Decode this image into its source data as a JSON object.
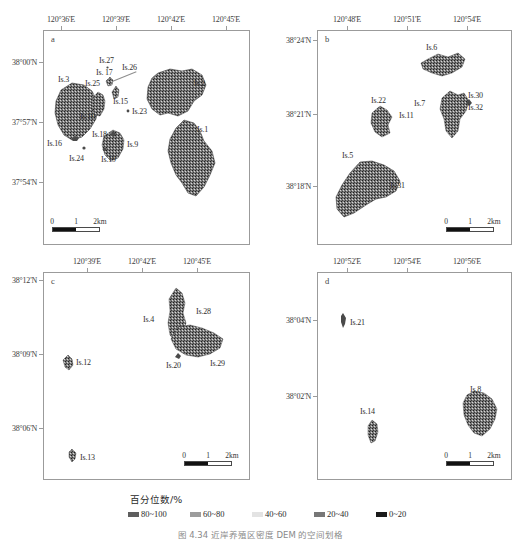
{
  "figure": {
    "caption": "图 4.34  近岸养殖区密度 DEM 的空间划格"
  },
  "legend": {
    "title": "百分位数/%",
    "items": [
      {
        "label": "80~100",
        "color": "#5e5e5e"
      },
      {
        "label": "60~80",
        "color": "#9c9c9c"
      },
      {
        "label": "40~60",
        "color": "#e3e3e3"
      },
      {
        "label": "20~40",
        "color": "#777777"
      },
      {
        "label": "0~20",
        "color": "#1a1a1a"
      }
    ]
  },
  "scalebar": {
    "ticks": [
      "0",
      "1",
      "2km"
    ]
  },
  "panels": [
    {
      "id": "a",
      "letter": "a",
      "x_ticks": [
        "120°36'E",
        "120°39'E",
        "120°42'E",
        "120°45'E"
      ],
      "y_ticks": [
        "38°00'N",
        "37°57'N",
        "37°54'N"
      ],
      "islands": [
        {
          "name": "Is.3",
          "x": 14,
          "y": 44
        },
        {
          "name": "Is.27",
          "x": 55,
          "y": 25
        },
        {
          "name": "Is. 17",
          "x": 52,
          "y": 37
        },
        {
          "name": "Is.26",
          "x": 78,
          "y": 32
        },
        {
          "name": "Is.25",
          "x": 41,
          "y": 48
        },
        {
          "name": "Is.2",
          "x": 150,
          "y": 48
        },
        {
          "name": "Is.15",
          "x": 69,
          "y": 66
        },
        {
          "name": "Is.10",
          "x": 36,
          "y": 81
        },
        {
          "name": "Is.23",
          "x": 88,
          "y": 80
        },
        {
          "name": "Is.18",
          "x": 48,
          "y": 100
        },
        {
          "name": "Is.9",
          "x": 83,
          "y": 109
        },
        {
          "name": "Is.1",
          "x": 153,
          "y": 94
        },
        {
          "name": "Is.16",
          "x": 6,
          "y": 108
        },
        {
          "name": "Is.24",
          "x": 25,
          "y": 123
        },
        {
          "name": "Is.19",
          "x": 57,
          "y": 124
        }
      ]
    },
    {
      "id": "b",
      "letter": "b",
      "x_ticks": [
        "120°48'E",
        "120°51'E",
        "120°54'E"
      ],
      "y_ticks": [
        "38°24'N",
        "38°21'N",
        "38°18'N"
      ],
      "islands": [
        {
          "name": "Is.6",
          "x": 108,
          "y": 12
        },
        {
          "name": "Is.22",
          "x": 53,
          "y": 65
        },
        {
          "name": "Is.11",
          "x": 81,
          "y": 80
        },
        {
          "name": "Is.7",
          "x": 98,
          "y": 68
        },
        {
          "name": "Is.30",
          "x": 139,
          "y": 61
        },
        {
          "name": "Is.32",
          "x": 139,
          "y": 73
        },
        {
          "name": "Is.5",
          "x": 24,
          "y": 122
        },
        {
          "name": "Is.31",
          "x": 70,
          "y": 150
        }
      ]
    },
    {
      "id": "c",
      "letter": "c",
      "x_ticks": [
        "120°39'E",
        "120°42'E",
        "120°45'E"
      ],
      "y_ticks": [
        "38°12'N",
        "38°09'N",
        "38°06'N"
      ],
      "islands": [
        {
          "name": "Is.4",
          "x": 111,
          "y": 42
        },
        {
          "name": "Is.28",
          "x": 152,
          "y": 34
        },
        {
          "name": "Is.20",
          "x": 131,
          "y": 88
        },
        {
          "name": "Is.29",
          "x": 178,
          "y": 86
        },
        {
          "name": "Is.12",
          "x": 30,
          "y": 90
        },
        {
          "name": "Is.13",
          "x": 36,
          "y": 183
        }
      ]
    },
    {
      "id": "d",
      "letter": "d",
      "x_ticks": [
        "120°52'E",
        "120°54'E",
        "120°56'E"
      ],
      "y_ticks": [
        "38°04'N",
        "38°02'N"
      ],
      "islands": [
        {
          "name": "Is.21",
          "x": 34,
          "y": 45
        },
        {
          "name": "Is.8",
          "x": 152,
          "y": 117
        },
        {
          "name": "Is.14",
          "x": 50,
          "y": 135
        }
      ]
    }
  ]
}
